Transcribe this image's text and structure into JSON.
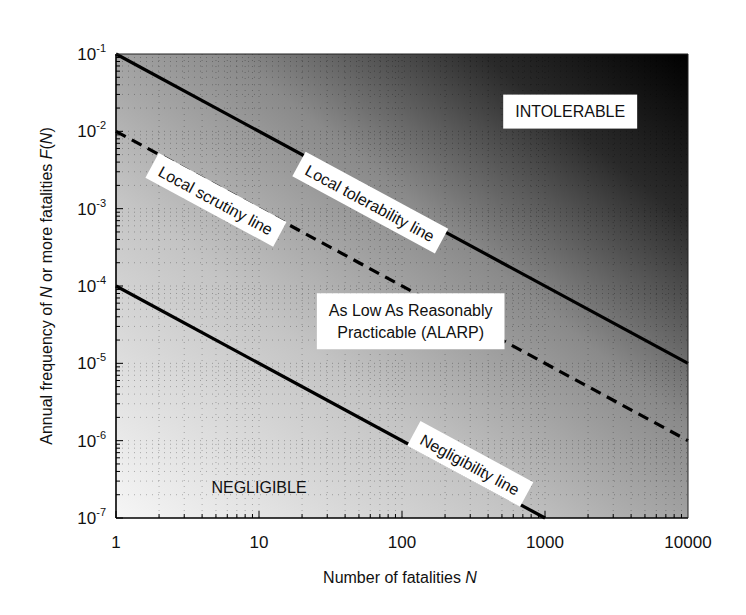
{
  "chart_data": {
    "type": "line",
    "title": "",
    "xlabel": "Number of fatalities N",
    "xlabel_parts": [
      "Number of fatalities ",
      "N"
    ],
    "ylabel": "Annual frequency of N or more fatalities F(N)",
    "ylabel_parts": [
      "Annual frequency of ",
      "N",
      " or more fatalities ",
      "F",
      "(",
      "N",
      ")"
    ],
    "xscale": "log",
    "yscale": "log",
    "xlim": [
      1,
      10000
    ],
    "ylim": [
      1e-07,
      0.1
    ],
    "x_ticks": [
      1,
      10,
      100,
      1000,
      10000
    ],
    "x_tick_labels": [
      "1",
      "10",
      "100",
      "1000",
      "10000"
    ],
    "y_ticks": [
      0.1,
      0.01,
      0.001,
      0.0001,
      1e-05,
      1e-06,
      1e-07
    ],
    "y_tick_labels": [
      {
        "base": "10",
        "exp": "-1"
      },
      {
        "base": "10",
        "exp": "-2"
      },
      {
        "base": "10",
        "exp": "-3"
      },
      {
        "base": "10",
        "exp": "-4"
      },
      {
        "base": "10",
        "exp": "-5"
      },
      {
        "base": "10",
        "exp": "-6"
      },
      {
        "base": "10",
        "exp": "-7"
      }
    ],
    "grid": true,
    "background": "diagonal gradient, light (bottom-left) to black (top-right)",
    "series": [
      {
        "name": "Local tolerability line",
        "style": "solid",
        "x": [
          1,
          10000
        ],
        "y": [
          0.1,
          1e-05
        ]
      },
      {
        "name": "Local scrutiny line",
        "style": "dashed",
        "x": [
          1,
          10000
        ],
        "y": [
          0.01,
          1e-06
        ]
      },
      {
        "name": "Negligibility line",
        "style": "solid",
        "x": [
          1,
          1000
        ],
        "y": [
          0.0001,
          1e-07
        ]
      }
    ],
    "line_labels": [
      {
        "text": "Local tolerability line",
        "series": 0,
        "x": 60,
        "y": 0.0012
      },
      {
        "text": "Local scrutiny line",
        "series": 1,
        "x": 5,
        "y": 0.0013
      },
      {
        "text": "Negligibility line",
        "series": 2,
        "x": 300,
        "y": 5e-07
      }
    ],
    "region_labels": [
      {
        "text": "INTOLERABLE",
        "x": 1500,
        "y": 0.018
      },
      {
        "text": "As Low As Reasonably Practicable (ALARP)",
        "lines": [
          "As Low As Reasonably",
          "Practicable (ALARP)"
        ],
        "x": 115,
        "y": 3.5e-05
      },
      {
        "text": "NEGLIGIBLE",
        "x": 10,
        "y": 2.5e-07
      }
    ],
    "colors": {
      "line": "#000000",
      "label_box": "#ffffff",
      "gradient_light": "#f4f4f4",
      "gradient_mid": "#9a9a9a",
      "gradient_dark": "#000000"
    }
  }
}
